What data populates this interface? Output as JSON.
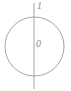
{
  "figure": {
    "kind": "circle-with-vertical-axis-diagram",
    "background_color": "#ffffff",
    "stroke_color": "#9a9a9a",
    "label_color": "#8a8a8a",
    "width": 71,
    "height": 91
  },
  "shapes": {
    "circle": {
      "name": "circle-outline",
      "center_x": 34.5,
      "center_y": 46.5,
      "radius": 29.5,
      "stroke": "#9a9a9a",
      "stroke_width": 0.9,
      "fill": "none"
    },
    "axis": {
      "name": "vertical-axis-line",
      "x": 34,
      "y_top": 3,
      "y_bottom": 89,
      "stroke": "#9a9a9a",
      "stroke_width": 0.9
    }
  },
  "labels": {
    "top": "1",
    "center": "0"
  },
  "chart_data": {
    "type": "diagram",
    "title": "",
    "elements": [
      {
        "element": "circle",
        "label": ""
      },
      {
        "element": "vertical-line",
        "label": ""
      },
      {
        "element": "point-label",
        "label": "1",
        "position": "top"
      },
      {
        "element": "point-label",
        "label": "0",
        "position": "center"
      }
    ]
  }
}
